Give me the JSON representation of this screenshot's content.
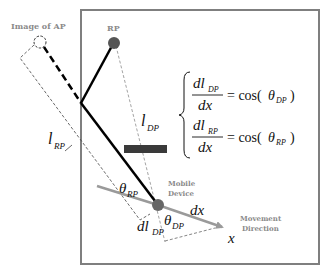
{
  "diagram": {
    "labels": {
      "image_of_ap": "Image of AP",
      "rp": "RP",
      "mobile_device_line1": "Mobile",
      "mobile_device_line2": "Device",
      "movement_line1": "Movement",
      "movement_line2": "Direction",
      "x_axis": "x",
      "dx": "dx",
      "l_dp_main": "l",
      "l_dp_sub": "DP",
      "l_rp_main": "l",
      "l_rp_sub": "RP",
      "theta_rp_main": "θ",
      "theta_rp_sub": "RP",
      "theta_dp_main": "θ",
      "theta_dp_sub": "DP",
      "dl_dp_main": "dl",
      "dl_dp_sub": "DP"
    },
    "equations": [
      {
        "num_main": "dl",
        "num_sub": "DP",
        "den": "dx",
        "rhs_prefix": "= cos(",
        "rhs_theta": "θ",
        "rhs_sub": "DP",
        "rhs_suffix": ")"
      },
      {
        "num_main": "dl",
        "num_sub": "RP",
        "den": "dx",
        "rhs_prefix": "= cos(",
        "rhs_theta": "θ",
        "rhs_sub": "RP",
        "rhs_suffix": ")"
      }
    ],
    "colors": {
      "frame": "#7f7f7f",
      "path": "#000000",
      "node": "#555555",
      "movement": "#9a9a9a",
      "obstacle": "#3a3a3a",
      "label_gray": "#8a8a8a"
    }
  }
}
